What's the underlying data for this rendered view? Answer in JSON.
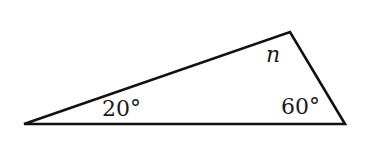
{
  "figure": {
    "type": "triangle",
    "stroke_color": "#111111",
    "vertices": {
      "left": [
        24,
        124
      ],
      "top": [
        290,
        32
      ],
      "right": [
        345,
        124
      ]
    }
  },
  "labels": {
    "left_angle": "20°",
    "right_angle": "60°",
    "top_angle": "n"
  }
}
